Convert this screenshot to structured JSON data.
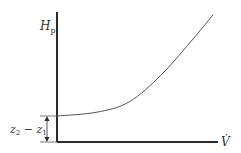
{
  "diagram": {
    "type": "pump system curve",
    "y_axis_label": "H",
    "y_axis_subscript": "p",
    "x_axis_label": "V̇",
    "offset_label_parts": [
      "z",
      "2",
      " − z",
      "1"
    ],
    "colors": {
      "axis": "#2a2a2a",
      "curve": "#555555",
      "text": "#333333"
    },
    "curve": {
      "description": "quadratic rise from static head",
      "static_head_fraction": 0.2,
      "points_normalized": [
        [
          0,
          0.2
        ],
        [
          0.25,
          0.23
        ],
        [
          0.45,
          0.31
        ],
        [
          0.65,
          0.52
        ],
        [
          0.85,
          0.8
        ],
        [
          0.97,
          0.98
        ]
      ]
    }
  }
}
